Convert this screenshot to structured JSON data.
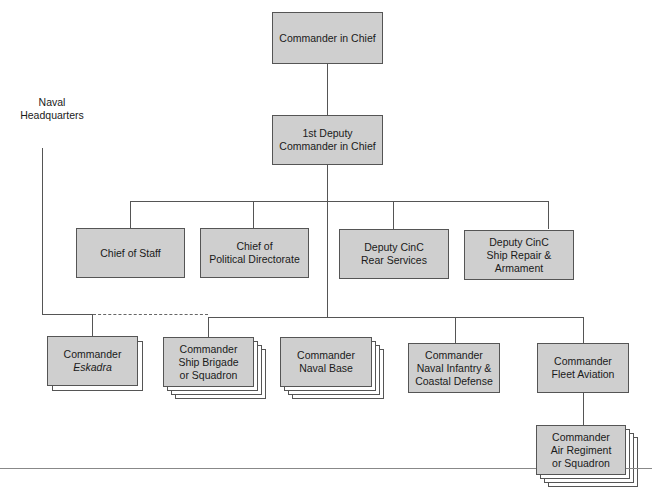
{
  "diagram": {
    "type": "org-chart",
    "side_label": {
      "line1": "Naval",
      "line2": "Headquarters"
    },
    "top": {
      "cinc": {
        "line1": "Commander in Chief"
      },
      "first_deputy": {
        "line1": "1st Deputy",
        "line2": "Commander in Chief"
      }
    },
    "staff_row": [
      {
        "line1": "Chief of Staff"
      },
      {
        "line1": "Chief of",
        "line2": "Political Directorate"
      },
      {
        "line1": "Deputy CinC",
        "line2": "Rear Services"
      },
      {
        "line1": "Deputy CinC",
        "line2": "Ship Repair & Armament"
      }
    ],
    "command_row": [
      {
        "line1": "Commander",
        "line2": "Eskadra",
        "multiple": true
      },
      {
        "line1": "Commander",
        "line2": "Ship Brigade",
        "line3": "or Squadron",
        "multiple": true
      },
      {
        "line1": "Commander",
        "line2": "Naval Base",
        "multiple": true
      },
      {
        "line1": "Commander",
        "line2": "Naval Infantry &",
        "line3": "Coastal Defense",
        "multiple": false
      },
      {
        "line1": "Commander",
        "line2": "Fleet Aviation",
        "multiple": false
      }
    ],
    "aviation_sub": {
      "line1": "Commander",
      "line2": "Air Regiment",
      "line3": "or Squadron",
      "multiple": true
    }
  }
}
